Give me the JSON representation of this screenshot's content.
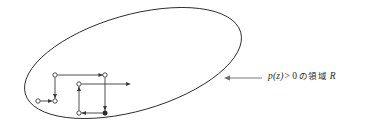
{
  "figure": {
    "background_color": "#ffffff",
    "width": 371,
    "height": 127
  },
  "region": {
    "name": "region-R",
    "shape": "ellipse",
    "label_full": "p(z) > 0 の領域 R",
    "stroke_color": "#2b2b2b",
    "fill": "none",
    "center_x": 133,
    "center_y": 63,
    "radius_x": 112,
    "radius_y": 48,
    "rotation_deg": -16
  },
  "annotation": {
    "name": "region-label",
    "pointer_color": "#6a6a6a",
    "text_color": "#2b2b2b",
    "parts": {
      "prob_fn": "p(",
      "prob_var": "z",
      "prob_close": ")",
      "operator": ">",
      "threshold": "0",
      "japanese": "の領域",
      "region_symbol": "R"
    },
    "pointer": {
      "x_start": 262,
      "x_end": 225,
      "y": 78
    }
  },
  "walk": {
    "name": "random-walk-path",
    "edge_color": "#3a3a3a",
    "node_open_fill": "#ffffff",
    "node_filled_fill": "#2b2b2b",
    "node_radius": 2.2,
    "nodes": [
      {
        "id": "n1",
        "x": 38,
        "y": 101,
        "style": "open"
      },
      {
        "id": "n2",
        "x": 55,
        "y": 101,
        "style": "open"
      },
      {
        "id": "n3",
        "x": 55,
        "y": 75,
        "style": "open"
      },
      {
        "id": "n4",
        "x": 105,
        "y": 75,
        "style": "open"
      },
      {
        "id": "n5",
        "x": 105,
        "y": 113,
        "style": "filled"
      },
      {
        "id": "n6",
        "x": 79,
        "y": 113,
        "style": "open"
      },
      {
        "id": "n7",
        "x": 79,
        "y": 84,
        "style": "open"
      },
      {
        "id": "n8",
        "x": 131,
        "y": 84,
        "style": "arrow-end"
      }
    ],
    "edges": [
      {
        "from": "n1",
        "to": "n2",
        "direction": "right"
      },
      {
        "from": "n3",
        "to": "n2",
        "direction": "down"
      },
      {
        "from": "n3",
        "to": "n4",
        "direction": "right"
      },
      {
        "from": "n4",
        "to": "n5",
        "direction": "down"
      },
      {
        "from": "n5",
        "to": "n6",
        "direction": "left"
      },
      {
        "from": "n6",
        "to": "n7",
        "direction": "up"
      },
      {
        "from": "n7",
        "to": "n8",
        "direction": "right"
      }
    ]
  }
}
